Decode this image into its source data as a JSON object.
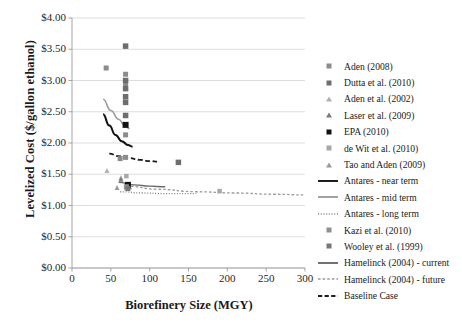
{
  "chart_data": {
    "type": "scatter",
    "title": "",
    "xlabel": "Biorefinery Size (MGY)",
    "ylabel": "Levelized Cost ($/gallon ethanol)",
    "xlim": [
      0,
      300
    ],
    "ylim": [
      0,
      4.0
    ],
    "xticks": [
      "0",
      "50",
      "100",
      "150",
      "200",
      "250",
      "300"
    ],
    "xtick_values": [
      0,
      50,
      100,
      150,
      200,
      250,
      300
    ],
    "yticks": [
      "$0.00",
      "$0.50",
      "$1.00",
      "$1.50",
      "$2.00",
      "$2.50",
      "$3.00",
      "$3.50",
      "$4.00"
    ],
    "ytick_values": [
      0,
      0.5,
      1.0,
      1.5,
      2.0,
      2.5,
      3.0,
      3.5,
      4.0
    ],
    "grid": "horizontal",
    "legend_position": "right",
    "series": [
      {
        "name": "Aden (2008)",
        "marker": "square",
        "color": "#8c8c8c",
        "size": 5,
        "points": [
          [
            44,
            3.2
          ],
          [
            69,
            3.1
          ],
          [
            69,
            2.95
          ],
          [
            69,
            2.13
          ],
          [
            69,
            1.77
          ],
          [
            62,
            1.75
          ]
        ]
      },
      {
        "name": "Dutta et al. (2010)",
        "marker": "square",
        "color": "#6e6e6e",
        "size": 5.5,
        "points": [
          [
            69,
            3.55
          ],
          [
            69,
            3.0
          ],
          [
            69,
            2.87
          ],
          [
            69,
            2.74
          ],
          [
            69,
            2.65
          ],
          [
            69,
            2.44
          ],
          [
            137,
            1.69
          ]
        ]
      },
      {
        "name": "Aden et al. (2002)",
        "marker": "triangle",
        "color": "#b0b0b0",
        "size": 5,
        "points": [
          [
            45,
            1.56
          ],
          [
            63,
            1.45
          ],
          [
            70,
            1.28
          ]
        ]
      },
      {
        "name": "Laser et al. (2009)",
        "marker": "triangle",
        "color": "#7a7a7a",
        "size": 5,
        "points": [
          [
            63,
            1.42
          ],
          [
            74,
            1.3
          ]
        ]
      },
      {
        "name": "EPA (2010)",
        "marker": "square",
        "color": "#121212",
        "size": 6,
        "points": [
          [
            69,
            2.29
          ],
          [
            72,
            1.33
          ]
        ]
      },
      {
        "name": "de Wit et al. (2010)",
        "marker": "square",
        "color": "#a8a8a8",
        "size": 4.5,
        "points": [
          [
            70,
            1.47
          ],
          [
            190,
            1.23
          ]
        ]
      },
      {
        "name": "Tao and Aden (2009)",
        "marker": "triangle",
        "color": "#9a9a9a",
        "size": 5,
        "points": [
          [
            58,
            1.29
          ]
        ]
      },
      {
        "name": "Kazi et al. (2010)",
        "marker": "square",
        "color": "#909090",
        "size": 5,
        "points": [
          [
            70,
            1.3
          ]
        ]
      },
      {
        "name": "Wooley et al. (1999)",
        "marker": "square",
        "color": "#777777",
        "size": 5,
        "points": [
          [
            72,
            1.27
          ]
        ]
      }
    ],
    "lines": [
      {
        "name": "Antares - near term",
        "style": "solid",
        "color": "#111111",
        "width": 2.0,
        "points": [
          [
            40,
            2.46
          ],
          [
            48,
            2.28
          ],
          [
            56,
            2.13
          ],
          [
            64,
            2.03
          ],
          [
            72,
            1.97
          ],
          [
            78,
            1.94
          ]
        ]
      },
      {
        "name": "Antares - mid term",
        "style": "solid",
        "color": "#9d9d9d",
        "width": 1.6,
        "points": [
          [
            40,
            2.7
          ],
          [
            50,
            2.52
          ],
          [
            60,
            2.38
          ],
          [
            68,
            2.28
          ],
          [
            74,
            2.23
          ]
        ]
      },
      {
        "name": "Antares - long term",
        "style": "dotted",
        "color": "#8a8a8a",
        "width": 1.3,
        "points": [
          [
            62,
            1.22
          ],
          [
            90,
            1.2
          ],
          [
            120,
            1.19
          ],
          [
            160,
            1.19
          ]
        ]
      },
      {
        "name": "Hamelinck (2004) - current",
        "style": "solid",
        "color": "#6a6a6a",
        "width": 1.4,
        "points": [
          [
            60,
            1.37
          ],
          [
            80,
            1.33
          ],
          [
            100,
            1.31
          ],
          [
            120,
            1.3
          ]
        ]
      },
      {
        "name": "Hamelinck (2004) - future",
        "style": "dashed-fine",
        "color": "#9b9b9b",
        "width": 1.3,
        "points": [
          [
            70,
            1.31
          ],
          [
            110,
            1.26
          ],
          [
            160,
            1.22
          ],
          [
            210,
            1.2
          ],
          [
            260,
            1.18
          ],
          [
            300,
            1.17
          ]
        ]
      },
      {
        "name": "Baseline Case",
        "style": "dashed",
        "color": "#1c1c1c",
        "width": 1.8,
        "points": [
          [
            48,
            1.83
          ],
          [
            60,
            1.79
          ],
          [
            72,
            1.76
          ],
          [
            88,
            1.73
          ],
          [
            100,
            1.71
          ],
          [
            112,
            1.7
          ]
        ]
      }
    ]
  },
  "axis": {
    "ylabel": "Levelized Cost ($/gallon ethanol)",
    "xlabel": "Biorefinery Size (MGY)",
    "yticks": [
      "$4.00",
      "$3.50",
      "$3.00",
      "$2.50",
      "$2.00",
      "$1.50",
      "$1.00",
      "$0.50",
      "$0.00"
    ],
    "xticks": [
      "0",
      "50",
      "100",
      "150",
      "200",
      "250",
      "300"
    ]
  },
  "legend": {
    "items": [
      {
        "label": "Aden (2008)",
        "key": "square",
        "color": "#8c8c8c"
      },
      {
        "label": "Dutta et al. (2010)",
        "key": "square",
        "color": "#6e6e6e"
      },
      {
        "label": "Aden et al. (2002)",
        "key": "triangle",
        "color": "#b0b0b0"
      },
      {
        "label": "Laser et al. (2009)",
        "key": "triangle",
        "color": "#7a7a7a"
      },
      {
        "label": "EPA (2010)",
        "key": "square",
        "color": "#121212"
      },
      {
        "label": "de Wit et al. (2010)",
        "key": "square",
        "color": "#a8a8a8"
      },
      {
        "label": "Tao and Aden (2009)",
        "key": "triangle",
        "color": "#9a9a9a"
      },
      {
        "label": "Antares - near term",
        "key": "line-solid",
        "color": "#111111"
      },
      {
        "label": "Antares - mid term",
        "key": "line-solid",
        "color": "#9d9d9d"
      },
      {
        "label": "Antares - long term",
        "key": "line-dotted",
        "color": "#8a8a8a"
      },
      {
        "label": "Kazi et al. (2010)",
        "key": "square",
        "color": "#909090"
      },
      {
        "label": "Wooley et al. (1999)",
        "key": "square",
        "color": "#777777"
      },
      {
        "label": "Hamelinck (2004) - current",
        "key": "line-solid",
        "color": "#6a6a6a"
      },
      {
        "label": "Hamelinck (2004) - future",
        "key": "line-dashed-fine",
        "color": "#9b9b9b"
      },
      {
        "label": "Baseline Case",
        "key": "line-dashed",
        "color": "#1c1c1c"
      }
    ]
  },
  "caption": {
    "text": ""
  },
  "colors": {
    "grid": "#d4d4d4",
    "axis": "#9a9a9a",
    "text": "#1a1a1a"
  }
}
